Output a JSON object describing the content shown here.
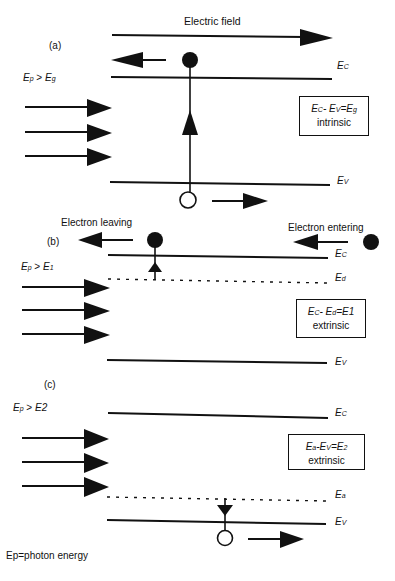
{
  "diagram": {
    "title": "Electric field",
    "footnote": "Ep=photon energy",
    "panels": [
      {
        "id": "a",
        "label": "(a)",
        "condition": {
          "left": "E",
          "left_sub": "p",
          "op": " > ",
          "right": "E",
          "right_sub": "g"
        },
        "levels": {
          "upper": {
            "main": "E",
            "sub": "C"
          },
          "lower": {
            "main": "E",
            "sub": "V"
          }
        },
        "box": {
          "eq_line": "EC-EV=Eg",
          "a": "E",
          "a_sub": "C",
          "b": "- E",
          "b_sub": "V",
          "c": "=E",
          "c_sub": "g",
          "type": "intrinsic"
        }
      },
      {
        "id": "b",
        "label": "(b)",
        "condition": {
          "left": "E",
          "left_sub": "p",
          "op": " > ",
          "right": "E",
          "right_sub": "1"
        },
        "electron_leaving": "Electron leaving",
        "electron_entering": "Electron entering",
        "levels": {
          "upper": {
            "main": "E",
            "sub": "C"
          },
          "dotted": {
            "main": "E",
            "sub": "d"
          },
          "lower": {
            "main": "E",
            "sub": "V"
          }
        },
        "box": {
          "a": "E",
          "a_sub": "C",
          "b": "- E",
          "b_sub": "d",
          "c": "=E1",
          "c_sub": "",
          "type": "extrinsic"
        }
      },
      {
        "id": "c",
        "label": "(c)",
        "condition": {
          "left": "E",
          "left_sub": "p",
          "op": " > ",
          "right": "E2",
          "right_sub": ""
        },
        "levels": {
          "upper": {
            "main": "E",
            "sub": "C"
          },
          "dotted": {
            "main": "E",
            "sub": "a"
          },
          "lower": {
            "main": "E",
            "sub": "V"
          }
        },
        "box": {
          "a": "E",
          "a_sub": "a",
          "b": "-E",
          "b_sub": "V",
          "c": "=E",
          "c_sub": "2",
          "type": "extrinsic"
        }
      }
    ]
  }
}
